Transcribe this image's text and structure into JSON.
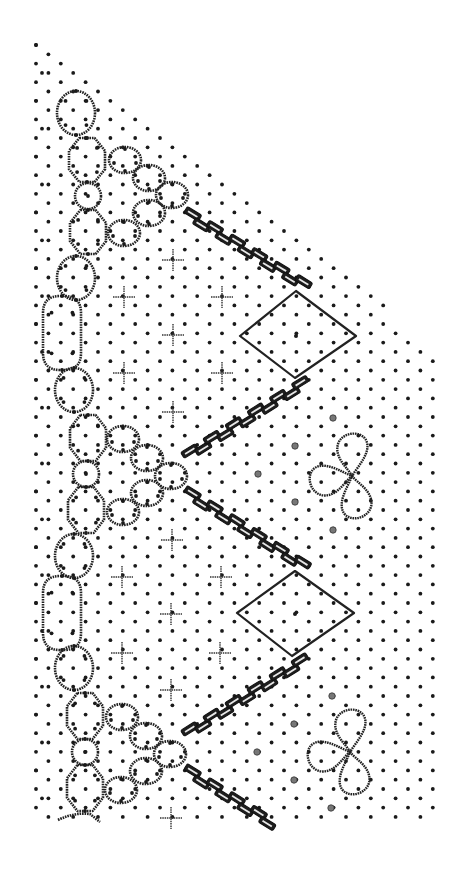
{
  "diagram": {
    "type": "bobbin-lace-pricking",
    "title": "",
    "caption": "",
    "colors": {
      "ink": "#1a1a1a",
      "background": "#ffffff"
    },
    "dot_lattice": {
      "col_spacing": 12.4,
      "row_spacing": 9.3,
      "origin": [
        36,
        45
      ],
      "top_edge": {
        "from": [
          36,
          45
        ],
        "to": [
          433,
          345
        ]
      },
      "right_edge_x": 433,
      "bottom_y": 818,
      "left_edge_x": 30
    },
    "period": 278,
    "repeats": 2,
    "elements": {
      "footside_chain": [
        {
          "kind": "oval",
          "cx": 76,
          "cy": 113,
          "rx": 19,
          "ry": 22
        },
        {
          "kind": "octagon",
          "cx": 87,
          "cy": 160,
          "rx": 18,
          "ry": 22
        },
        {
          "kind": "circle",
          "cx": 88,
          "cy": 196,
          "rx": 13,
          "ry": 13
        },
        {
          "kind": "octagon",
          "cx": 88,
          "cy": 232,
          "rx": 18,
          "ry": 22
        },
        {
          "kind": "oval",
          "cx": 76,
          "cy": 278,
          "rx": 19,
          "ry": 22
        },
        {
          "kind": "long-oval",
          "cx": 62,
          "cy": 333,
          "rx": 19,
          "ry": 37
        },
        {
          "kind": "oval",
          "cx": 74,
          "cy": 390,
          "rx": 19,
          "ry": 22
        },
        {
          "kind": "octagon",
          "cx": 88,
          "cy": 438,
          "rx": 18,
          "ry": 23
        },
        {
          "kind": "circle",
          "cx": 86,
          "cy": 474,
          "rx": 13,
          "ry": 13
        },
        {
          "kind": "octagon",
          "cx": 86,
          "cy": 510,
          "rx": 18,
          "ry": 23
        },
        {
          "kind": "oval",
          "cx": 74,
          "cy": 556,
          "rx": 19,
          "ry": 22
        },
        {
          "kind": "long-oval",
          "cx": 62,
          "cy": 613,
          "rx": 19,
          "ry": 37
        },
        {
          "kind": "oval",
          "cx": 74,
          "cy": 668,
          "rx": 19,
          "ry": 22
        },
        {
          "kind": "octagon",
          "cx": 85,
          "cy": 716,
          "rx": 18,
          "ry": 23
        },
        {
          "kind": "circle",
          "cx": 85,
          "cy": 752,
          "rx": 13,
          "ry": 13
        },
        {
          "kind": "octagon",
          "cx": 85,
          "cy": 788,
          "rx": 18,
          "ry": 23
        }
      ],
      "oval_fans": [
        {
          "cx": 125,
          "cy": 160,
          "rx": 16,
          "ry": 13
        },
        {
          "cx": 149,
          "cy": 178,
          "rx": 16,
          "ry": 13
        },
        {
          "cx": 172,
          "cy": 195,
          "rx": 16,
          "ry": 13
        },
        {
          "cx": 149,
          "cy": 213,
          "rx": 16,
          "ry": 13
        },
        {
          "cx": 124,
          "cy": 233,
          "rx": 16,
          "ry": 13
        },
        {
          "cx": 123,
          "cy": 439,
          "rx": 16,
          "ry": 13
        },
        {
          "cx": 147,
          "cy": 458,
          "rx": 16,
          "ry": 13
        },
        {
          "cx": 171,
          "cy": 476,
          "rx": 16,
          "ry": 13
        },
        {
          "cx": 147,
          "cy": 493,
          "rx": 16,
          "ry": 13
        },
        {
          "cx": 123,
          "cy": 512,
          "rx": 16,
          "ry": 13
        },
        {
          "cx": 122,
          "cy": 717,
          "rx": 16,
          "ry": 13
        },
        {
          "cx": 146,
          "cy": 736,
          "rx": 16,
          "ry": 13
        },
        {
          "cx": 170,
          "cy": 754,
          "rx": 16,
          "ry": 13
        },
        {
          "cx": 146,
          "cy": 771,
          "rx": 16,
          "ry": 13
        },
        {
          "cx": 121,
          "cy": 790,
          "rx": 16,
          "ry": 13
        }
      ],
      "plaits": [
        {
          "from": [
            184,
            212
          ],
          "to": [
            310,
            289
          ]
        },
        {
          "from": [
            184,
            458
          ],
          "to": [
            310,
            380
          ]
        },
        {
          "from": [
            184,
            491
          ],
          "to": [
            310,
            570
          ]
        },
        {
          "from": [
            184,
            736
          ],
          "to": [
            310,
            657
          ]
        },
        {
          "from": [
            184,
            769
          ],
          "to": [
            275,
            826
          ]
        }
      ],
      "diamonds": [
        {
          "top": [
            296,
            291
          ],
          "right": [
            356,
            336
          ],
          "bottom": [
            295,
            378
          ],
          "left": [
            240,
            336
          ],
          "center_dot": [
            296,
            336
          ]
        },
        {
          "top": [
            295,
            571
          ],
          "right": [
            354,
            613
          ],
          "bottom": [
            292,
            656
          ],
          "left": [
            237,
            613
          ],
          "center_dot": [
            295,
            614
          ]
        }
      ],
      "clovers": [
        {
          "cx": 352,
          "cy": 476
        },
        {
          "cx": 350,
          "cy": 752
        }
      ],
      "spider_dots": [
        [
          333,
          418
        ],
        [
          295,
          446
        ],
        [
          258,
          474
        ],
        [
          295,
          502
        ],
        [
          333,
          530
        ],
        [
          332,
          696
        ],
        [
          294,
          724
        ],
        [
          257,
          752
        ],
        [
          294,
          780
        ],
        [
          331,
          808
        ]
      ],
      "crosses": [
        [
          173,
          260
        ],
        [
          124,
          297
        ],
        [
          222,
          297
        ],
        [
          173,
          335
        ],
        [
          124,
          373
        ],
        [
          222,
          373
        ],
        [
          173,
          412
        ],
        [
          172,
          540
        ],
        [
          122,
          577
        ],
        [
          221,
          577
        ],
        [
          171,
          614
        ],
        [
          122,
          653
        ],
        [
          220,
          653
        ],
        [
          171,
          690
        ],
        [
          171,
          818
        ]
      ]
    },
    "legend": []
  }
}
